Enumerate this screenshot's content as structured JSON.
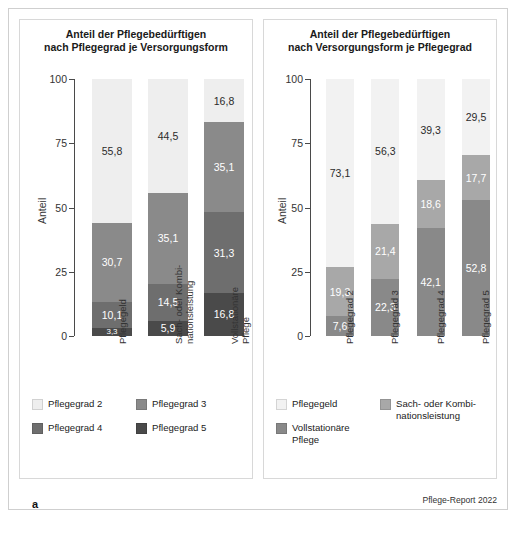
{
  "figure": {
    "source_note": "Pflege-Report 2022",
    "panel_a_letter": "a",
    "panel_b_letter": "b"
  },
  "colors": {
    "pg2": "#eeeeee",
    "pg3": "#8a8a8a",
    "pg4": "#6e6e6e",
    "pg5": "#4a4a4a",
    "pflegegeld": "#f2f2f2",
    "sach_kombi": "#a8a8a8",
    "vollstationaer": "#898989",
    "axis": "#4a4a4a",
    "frame": "#cfcfcf"
  },
  "panel_a": {
    "title_line1": "Anteil der Pflegebedürftigen",
    "title_line2": "nach Pflegegrad je Versorgungsform",
    "yaxis_title": "Anteil",
    "yticks": [
      "100",
      "75",
      "50",
      "25",
      "0"
    ],
    "xlabels": [
      "Pflegegeld",
      "Sach- oder Kombi-\nnationsleistung",
      "Vollstationäre\nPflege"
    ],
    "legend": [
      {
        "label": "Pflegegrad 2",
        "color": "#eeeeee"
      },
      {
        "label": "Pflegegrad 3",
        "color": "#8a8a8a"
      },
      {
        "label": "Pflegegrad 4",
        "color": "#6e6e6e"
      },
      {
        "label": "Pflegegrad 5",
        "color": "#4a4a4a"
      }
    ]
  },
  "panel_b": {
    "title_line1": "Anteil der Pflegebedürftigen",
    "title_line2": "nach Versorgungsform je Pflegegrad",
    "yaxis_title": "Anteil",
    "yticks": [
      "100",
      "75",
      "50",
      "25",
      "0"
    ],
    "xlabels": [
      "Pflegegrad 2",
      "Pflegegrad 3",
      "Pflegegrad 4",
      "Pflegegrad 5"
    ],
    "legend": [
      {
        "label": "Pflegegeld",
        "color": "#f2f2f2"
      },
      {
        "label": "Sach- oder Kombi-\nnationsleistung",
        "color": "#a8a8a8"
      },
      {
        "label": "Vollstationäre\nPflege",
        "color": "#898989"
      }
    ]
  },
  "chart_data": [
    {
      "type": "bar",
      "stacked": true,
      "panel": "a",
      "title": "Anteil der Pflegebedürftigen nach Pflegegrad je Versorgungsform",
      "xlabel": "",
      "ylabel": "Anteil",
      "ylim": [
        0,
        100
      ],
      "yticks": [
        0,
        25,
        50,
        75,
        100
      ],
      "grid": false,
      "legend_position": "bottom",
      "categories": [
        "Pflegegeld",
        "Sach- oder Kombinationsleistung",
        "Vollstationäre Pflege"
      ],
      "series": [
        {
          "name": "Pflegegrad 5",
          "color": "#4a4a4a",
          "values": [
            3.3,
            5.9,
            16.8
          ],
          "labels": [
            "3,3",
            "5,9",
            "16,8"
          ]
        },
        {
          "name": "Pflegegrad 4",
          "color": "#6e6e6e",
          "values": [
            10.1,
            14.5,
            31.3
          ],
          "labels": [
            "10,1",
            "14,5",
            "31,3"
          ]
        },
        {
          "name": "Pflegegrad 3",
          "color": "#8a8a8a",
          "values": [
            30.7,
            35.1,
            35.1
          ],
          "labels": [
            "30,7",
            "35,1",
            "35,1"
          ]
        },
        {
          "name": "Pflegegrad 2",
          "color": "#eeeeee",
          "values": [
            55.8,
            44.5,
            16.8
          ],
          "labels": [
            "55,8",
            "44,5",
            "16,8"
          ]
        }
      ]
    },
    {
      "type": "bar",
      "stacked": true,
      "panel": "b",
      "title": "Anteil der Pflegebedürftigen nach Versorgungsform je Pflegegrad",
      "xlabel": "",
      "ylabel": "Anteil",
      "ylim": [
        0,
        100
      ],
      "yticks": [
        0,
        25,
        50,
        75,
        100
      ],
      "grid": false,
      "legend_position": "bottom",
      "categories": [
        "Pflegegrad 2",
        "Pflegegrad 3",
        "Pflegegrad 4",
        "Pflegegrad 5"
      ],
      "series": [
        {
          "name": "Vollstationäre Pflege",
          "color": "#898989",
          "values": [
            7.6,
            22.3,
            42.1,
            52.8
          ],
          "labels": [
            "7,6",
            "22,3",
            "42,1",
            "52,8"
          ]
        },
        {
          "name": "Sach- oder Kombinationsleistung",
          "color": "#a8a8a8",
          "values": [
            19.3,
            21.4,
            18.6,
            17.7
          ],
          "labels": [
            "19,3",
            "21,4",
            "18,6",
            "17,7"
          ]
        },
        {
          "name": "Pflegegeld",
          "color": "#f2f2f2",
          "values": [
            73.1,
            56.3,
            39.3,
            29.5
          ],
          "labels": [
            "73,1",
            "56,3",
            "39,3",
            "29,5"
          ]
        }
      ]
    }
  ]
}
